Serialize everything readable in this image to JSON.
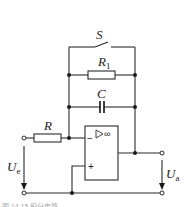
{
  "diagram": {
    "type": "circuit-schematic",
    "components": {
      "switch": {
        "label": "S"
      },
      "feedback_resistor": {
        "label": "R",
        "subscript": "1"
      },
      "capacitor": {
        "label": "C"
      },
      "input_resistor": {
        "label": "R"
      },
      "opamp": {
        "gain_symbol": "▷∞",
        "inverting_label": "−",
        "noninverting_label": "+"
      }
    },
    "voltages": {
      "input": {
        "label": "U",
        "subscript": "e"
      },
      "output": {
        "label": "U",
        "subscript": "a"
      }
    },
    "caption": "图 14.15 积分电路"
  }
}
